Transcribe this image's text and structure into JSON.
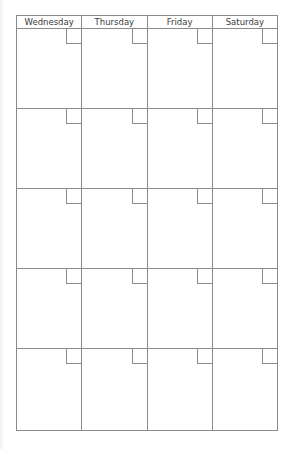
{
  "calendar": {
    "type": "blank-monthly-grid",
    "days": [
      "Wednesday",
      "Thursday",
      "Friday",
      "Saturday"
    ],
    "rows": 5,
    "weeks": [
      [
        "",
        "",
        "",
        ""
      ],
      [
        "",
        "",
        "",
        ""
      ],
      [
        "",
        "",
        "",
        ""
      ],
      [
        "",
        "",
        "",
        ""
      ],
      [
        "",
        "",
        "",
        ""
      ]
    ],
    "colors": {
      "grid_line": "#8a8a8a",
      "header_text": "#3a3a3a",
      "background": "#ffffff"
    }
  }
}
